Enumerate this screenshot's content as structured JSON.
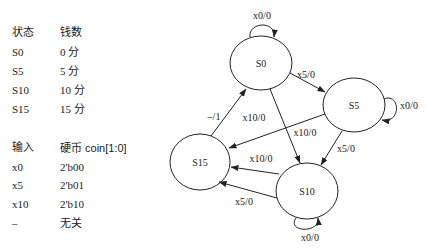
{
  "state_table": {
    "headers": [
      "状态",
      "钱数"
    ],
    "rows": [
      [
        "S0",
        "0 分"
      ],
      [
        "S5",
        "5 分"
      ],
      [
        "S10",
        "10 分"
      ],
      [
        "S15",
        "15 分"
      ]
    ]
  },
  "input_table": {
    "headers": [
      "输入",
      "硬币 coin[1:0]"
    ],
    "rows": [
      [
        "x0",
        "2'b00"
      ],
      [
        "x5",
        "2'b01"
      ],
      [
        "x10",
        "2'b10"
      ],
      [
        "–",
        "无关"
      ]
    ]
  },
  "diagram": {
    "states": [
      {
        "id": "S0",
        "label": "S0"
      },
      {
        "id": "S5",
        "label": "S5"
      },
      {
        "id": "S10",
        "label": "S10"
      },
      {
        "id": "S15",
        "label": "S15"
      }
    ],
    "transitions": [
      {
        "from": "S0",
        "to": "S0",
        "label": "x0/0"
      },
      {
        "from": "S0",
        "to": "S5",
        "label": "x5/0"
      },
      {
        "from": "S0",
        "to": "S10",
        "label": "x10/0"
      },
      {
        "from": "S5",
        "to": "S5",
        "label": "x0/0"
      },
      {
        "from": "S5",
        "to": "S10",
        "label": "x5/0"
      },
      {
        "from": "S5",
        "to": "S15",
        "label": "x10/0"
      },
      {
        "from": "S10",
        "to": "S10",
        "label": "x0/0"
      },
      {
        "from": "S10",
        "to": "S15",
        "label": "x10/0"
      },
      {
        "from": "S10",
        "to": "S15",
        "label": "x5/0"
      },
      {
        "from": "S15",
        "to": "S0",
        "label": "–/1"
      }
    ]
  }
}
